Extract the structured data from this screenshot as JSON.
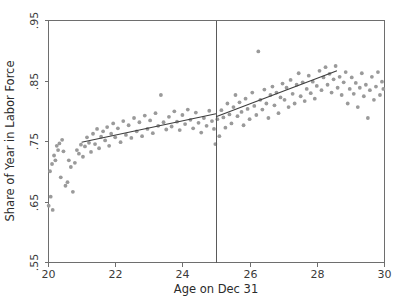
{
  "chart_data": {
    "type": "scatter",
    "title": "",
    "xlabel": "Age on Dec 31",
    "ylabel": "Share of Year in Labor Force",
    "xlim": [
      20,
      30
    ],
    "ylim": [
      0.55,
      0.95
    ],
    "xticks": [
      20,
      22,
      24,
      26,
      28,
      30
    ],
    "xtick_labels": [
      "20",
      "22",
      "24",
      "26",
      "28",
      "30"
    ],
    "yticks": [
      0.55,
      0.65,
      0.75,
      0.85,
      0.95
    ],
    "ytick_labels": [
      ".55",
      ".65",
      ".75",
      ".85",
      ".95"
    ],
    "grid": false,
    "legend": "none",
    "marker_color": "#9a9a9a",
    "line_color": "#3d3d3d",
    "frame_color": "#6e6e6e",
    "cutoff": {
      "x": 25,
      "label": "",
      "color": "#5a5a5a"
    },
    "fit_segments": [
      {
        "name": "left-fit",
        "x": [
          21.0,
          25.0
        ],
        "y": [
          0.748,
          0.795
        ]
      },
      {
        "name": "right-fit",
        "x": [
          25.0,
          28.6
        ],
        "y": [
          0.79,
          0.866
        ]
      }
    ],
    "series": [
      {
        "name": "Share of Year in Labor Force",
        "points": [
          [
            20.02,
            0.643
          ],
          [
            20.08,
            0.658
          ],
          [
            20.14,
            0.636
          ],
          [
            20.06,
            0.7
          ],
          [
            20.12,
            0.712
          ],
          [
            20.18,
            0.726
          ],
          [
            20.22,
            0.718
          ],
          [
            20.26,
            0.742
          ],
          [
            20.3,
            0.735
          ],
          [
            20.34,
            0.746
          ],
          [
            20.38,
            0.69
          ],
          [
            20.42,
            0.752
          ],
          [
            20.46,
            0.733
          ],
          [
            20.52,
            0.676
          ],
          [
            20.58,
            0.682
          ],
          [
            20.62,
            0.718
          ],
          [
            20.68,
            0.707
          ],
          [
            20.74,
            0.666
          ],
          [
            20.8,
            0.714
          ],
          [
            20.86,
            0.735
          ],
          [
            20.92,
            0.729
          ],
          [
            20.98,
            0.744
          ],
          [
            21.04,
            0.724
          ],
          [
            21.1,
            0.741
          ],
          [
            21.16,
            0.756
          ],
          [
            21.22,
            0.747
          ],
          [
            21.28,
            0.732
          ],
          [
            21.34,
            0.762
          ],
          [
            21.4,
            0.745
          ],
          [
            21.46,
            0.77
          ],
          [
            21.52,
            0.738
          ],
          [
            21.58,
            0.757
          ],
          [
            21.64,
            0.766
          ],
          [
            21.7,
            0.751
          ],
          [
            21.76,
            0.773
          ],
          [
            21.82,
            0.742
          ],
          [
            21.88,
            0.762
          ],
          [
            21.94,
            0.779
          ],
          [
            22.0,
            0.756
          ],
          [
            22.08,
            0.771
          ],
          [
            22.16,
            0.748
          ],
          [
            22.24,
            0.783
          ],
          [
            22.32,
            0.76
          ],
          [
            22.4,
            0.776
          ],
          [
            22.48,
            0.755
          ],
          [
            22.56,
            0.788
          ],
          [
            22.64,
            0.766
          ],
          [
            22.72,
            0.781
          ],
          [
            22.8,
            0.758
          ],
          [
            22.88,
            0.792
          ],
          [
            22.96,
            0.77
          ],
          [
            23.04,
            0.784
          ],
          [
            23.12,
            0.763
          ],
          [
            23.2,
            0.796
          ],
          [
            23.28,
            0.775
          ],
          [
            23.36,
            0.826
          ],
          [
            23.44,
            0.781
          ],
          [
            23.52,
            0.769
          ],
          [
            23.6,
            0.79
          ],
          [
            23.68,
            0.774
          ],
          [
            23.76,
            0.799
          ],
          [
            23.84,
            0.782
          ],
          [
            23.92,
            0.768
          ],
          [
            24.0,
            0.793
          ],
          [
            24.08,
            0.778
          ],
          [
            24.16,
            0.802
          ],
          [
            24.24,
            0.785
          ],
          [
            24.32,
            0.771
          ],
          [
            24.4,
            0.797
          ],
          [
            24.48,
            0.78
          ],
          [
            24.56,
            0.764
          ],
          [
            24.64,
            0.788
          ],
          [
            24.72,
            0.775
          ],
          [
            24.8,
            0.8
          ],
          [
            24.88,
            0.783
          ],
          [
            24.94,
            0.77
          ],
          [
            24.98,
            0.745
          ],
          [
            25.04,
            0.786
          ],
          [
            25.1,
            0.758
          ],
          [
            25.16,
            0.801
          ],
          [
            25.22,
            0.789
          ],
          [
            25.28,
            0.772
          ],
          [
            25.34,
            0.812
          ],
          [
            25.4,
            0.794
          ],
          [
            25.46,
            0.779
          ],
          [
            25.52,
            0.806
          ],
          [
            25.58,
            0.826
          ],
          [
            25.64,
            0.791
          ],
          [
            25.7,
            0.814
          ],
          [
            25.76,
            0.798
          ],
          [
            25.82,
            0.776
          ],
          [
            25.88,
            0.82
          ],
          [
            25.94,
            0.803
          ],
          [
            26.0,
            0.786
          ],
          [
            26.08,
            0.83
          ],
          [
            26.14,
            0.808
          ],
          [
            26.2,
            0.793
          ],
          [
            26.26,
            0.898
          ],
          [
            26.32,
            0.818
          ],
          [
            26.38,
            0.802
          ],
          [
            26.44,
            0.835
          ],
          [
            26.5,
            0.812
          ],
          [
            26.56,
            0.788
          ],
          [
            26.62,
            0.826
          ],
          [
            26.68,
            0.84
          ],
          [
            26.74,
            0.809
          ],
          [
            26.8,
            0.83
          ],
          [
            26.86,
            0.796
          ],
          [
            26.92,
            0.822
          ],
          [
            26.98,
            0.845
          ],
          [
            27.04,
            0.818
          ],
          [
            27.1,
            0.838
          ],
          [
            27.16,
            0.806
          ],
          [
            27.22,
            0.851
          ],
          [
            27.28,
            0.828
          ],
          [
            27.34,
            0.812
          ],
          [
            27.4,
            0.843
          ],
          [
            27.46,
            0.862
          ],
          [
            27.52,
            0.824
          ],
          [
            27.58,
            0.847
          ],
          [
            27.64,
            0.816
          ],
          [
            27.7,
            0.836
          ],
          [
            27.76,
            0.858
          ],
          [
            27.82,
            0.829
          ],
          [
            27.88,
            0.848
          ],
          [
            27.94,
            0.82
          ],
          [
            28.0,
            0.841
          ],
          [
            28.08,
            0.866
          ],
          [
            28.14,
            0.834
          ],
          [
            28.2,
            0.855
          ],
          [
            28.26,
            0.872
          ],
          [
            28.32,
            0.843
          ],
          [
            28.38,
            0.861
          ],
          [
            28.44,
            0.83
          ],
          [
            28.5,
            0.852
          ],
          [
            28.56,
            0.874
          ],
          [
            28.62,
            0.838
          ],
          [
            28.68,
            0.856
          ],
          [
            28.74,
            0.826
          ],
          [
            28.8,
            0.847
          ],
          [
            28.86,
            0.864
          ],
          [
            28.92,
            0.812
          ],
          [
            28.98,
            0.836
          ],
          [
            29.04,
            0.855
          ],
          [
            29.1,
            0.828
          ],
          [
            29.16,
            0.846
          ],
          [
            29.22,
            0.806
          ],
          [
            29.28,
            0.838
          ],
          [
            29.34,
            0.862
          ],
          [
            29.4,
            0.824
          ],
          [
            29.46,
            0.843
          ],
          [
            29.52,
            0.788
          ],
          [
            29.58,
            0.834
          ],
          [
            29.64,
            0.856
          ],
          [
            29.7,
            0.818
          ],
          [
            29.76,
            0.84
          ],
          [
            29.82,
            0.864
          ],
          [
            29.88,
            0.826
          ],
          [
            29.94,
            0.848
          ],
          [
            29.98,
            0.836
          ]
        ]
      }
    ]
  }
}
